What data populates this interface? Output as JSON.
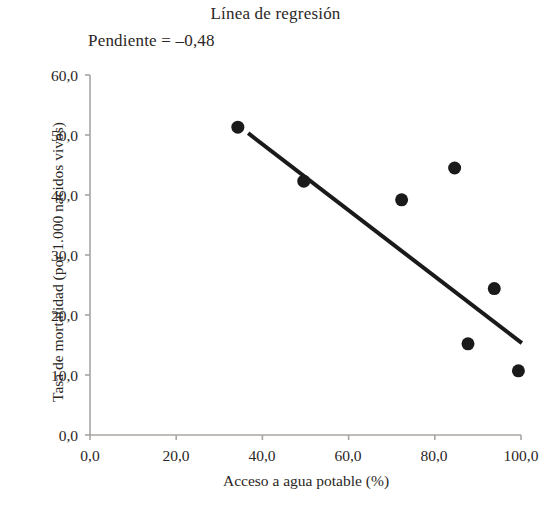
{
  "chart_data": {
    "type": "scatter",
    "title": "Línea de regresión",
    "annotation": "Pendiente = –0,48",
    "xlabel": "Acceso a agua potable (%)",
    "ylabel": "Tasa de mortalidad (por 1.000 nacidos vivos)",
    "xlim": [
      0,
      100
    ],
    "ylim": [
      0,
      60
    ],
    "grid": false,
    "legend": "none",
    "xticks": [
      0,
      20,
      40,
      60,
      80,
      100
    ],
    "yticks": [
      0,
      10,
      20,
      30,
      40,
      50,
      60
    ],
    "xtick_labels": [
      "0,0",
      "20,0",
      "40,0",
      "60,0",
      "80,0",
      "100,0"
    ],
    "ytick_labels": [
      "0,0",
      "10,0",
      "20,0",
      "30,0",
      "40,0",
      "50,0",
      "60,0"
    ],
    "points": [
      {
        "x": 34.3,
        "y": 51.3
      },
      {
        "x": 49.6,
        "y": 42.3
      },
      {
        "x": 72.3,
        "y": 39.2
      },
      {
        "x": 84.6,
        "y": 44.5
      },
      {
        "x": 87.7,
        "y": 15.2
      },
      {
        "x": 93.8,
        "y": 24.4
      },
      {
        "x": 99.4,
        "y": 10.7
      }
    ],
    "series": [
      {
        "name": "Países",
        "type": "scatter",
        "marker": "filled-circle",
        "color": "#1a1a1a",
        "marker_size": 13,
        "x": [
          34.3,
          49.6,
          72.3,
          84.6,
          87.7,
          93.8,
          99.4
        ],
        "values": [
          51.3,
          42.3,
          39.2,
          44.5,
          15.2,
          24.4,
          10.7
        ]
      },
      {
        "name": "Línea de regresión",
        "type": "line",
        "color": "#1a1a1a",
        "line_width": 4,
        "slope": -0.48,
        "x_start": 36.7,
        "y_start": 50.3,
        "x_end": 100.2,
        "y_end": 15.3
      }
    ],
    "axis_color": "#a8a5a2",
    "marker_color": "#1a1a1a",
    "line_color": "#1a1a1a",
    "background": "#ffffff"
  }
}
